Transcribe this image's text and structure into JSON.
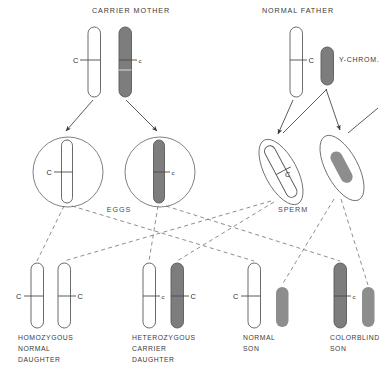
{
  "diagram": {
    "parents": [
      {
        "id": "mother",
        "label": "CARRIER MOTHER",
        "label_x": 131,
        "label_y": 13,
        "chromosomes": [
          {
            "id": "mother-x-normal",
            "type": "X",
            "fill": "white",
            "allele": "C",
            "allele_case": "upper",
            "allele_side": "left",
            "x": 88,
            "y": 27,
            "w": 12.5,
            "h": 70
          },
          {
            "id": "mother-x-carrier",
            "type": "X",
            "fill": "gray",
            "allele": "c",
            "allele_case": "lower",
            "allele_side": "right",
            "x": 119,
            "y": 27,
            "w": 12.5,
            "h": 70
          }
        ]
      },
      {
        "id": "father",
        "label": "NORMAL FATHER",
        "label_x": 298,
        "label_y": 13,
        "chromosomes": [
          {
            "id": "father-x",
            "type": "X",
            "fill": "white",
            "allele": "C",
            "allele_case": "upper",
            "allele_side": "right",
            "x": 290,
            "y": 27,
            "w": 12.5,
            "h": 70
          },
          {
            "id": "father-y",
            "type": "Y",
            "fill": "gray",
            "allele": "",
            "allele_case": "",
            "allele_side": "",
            "x": 321,
            "y": 47,
            "w": 12.5,
            "h": 38
          }
        ],
        "y_chrom_label": "Y-CHROM.",
        "y_chrom_label_x": 339,
        "y_chrom_label_y": 62
      }
    ],
    "gametes": [
      {
        "id": "egg-normal",
        "group": "EGGS",
        "shape": "circle",
        "cx": 68,
        "cy": 172,
        "r": 35,
        "chromosome": {
          "type": "X",
          "fill": "white",
          "allele": "C",
          "allele_case": "upper",
          "allele_side": "left"
        }
      },
      {
        "id": "egg-carrier",
        "group": "EGGS",
        "shape": "circle",
        "cx": 160,
        "cy": 172,
        "r": 35,
        "chromosome": {
          "type": "X",
          "fill": "gray",
          "allele": "c",
          "allele_case": "lower",
          "allele_side": "right"
        }
      },
      {
        "id": "sperm-x",
        "group": "SPERM",
        "shape": "ellipse",
        "cx": 281,
        "cy": 172,
        "rx": 16,
        "ry": 36,
        "rotation": -28,
        "chromosome": {
          "type": "X",
          "fill": "white",
          "allele": "C",
          "allele_case": "upper",
          "allele_side": "right"
        }
      },
      {
        "id": "sperm-y",
        "group": "SPERM",
        "shape": "ellipse",
        "cx": 342,
        "cy": 168,
        "rx": 16,
        "ry": 36,
        "rotation": -28,
        "chromosome": {
          "type": "Y",
          "fill": "gray",
          "allele": "",
          "allele_case": "",
          "allele_side": ""
        }
      }
    ],
    "gamete_group_labels": [
      {
        "id": "eggs-label",
        "text": "EGGS",
        "x": 119,
        "y": 212
      },
      {
        "id": "sperm-label",
        "text": "SPERM",
        "x": 293,
        "y": 212
      }
    ],
    "offspring": [
      {
        "id": "homozygous-normal-daughter",
        "caption_lines": [
          "HOMOZYGOUS",
          "NORMAL",
          "DAUGHTER"
        ],
        "caption_x": 18,
        "caption_y": 340,
        "chromosomes": [
          {
            "type": "X",
            "fill": "white",
            "allele": "C",
            "allele_case": "upper",
            "allele_side": "left",
            "x": 31,
            "y": 263,
            "w": 12.5,
            "h": 65
          },
          {
            "type": "X",
            "fill": "white",
            "allele": "C",
            "allele_case": "upper",
            "allele_side": "right",
            "x": 58,
            "y": 263,
            "w": 12.5,
            "h": 65
          }
        ]
      },
      {
        "id": "heterozygous-carrier-daughter",
        "caption_lines": [
          "HETEROZYGOUS",
          "CARRIER",
          "DAUGHTER"
        ],
        "caption_x": 132,
        "caption_y": 340,
        "chromosomes": [
          {
            "type": "X",
            "fill": "white",
            "allele": "c",
            "allele_case": "lower",
            "allele_side": "right",
            "x": 143,
            "y": 263,
            "w": 12.5,
            "h": 65
          },
          {
            "type": "X",
            "fill": "gray",
            "allele": "C",
            "allele_case": "upper",
            "allele_side": "right",
            "x": 171,
            "y": 263,
            "w": 12.5,
            "h": 65
          }
        ]
      },
      {
        "id": "normal-son",
        "caption_lines": [
          "NORMAL",
          "SON"
        ],
        "caption_x": 243,
        "caption_y": 340,
        "chromosomes": [
          {
            "type": "X",
            "fill": "white",
            "allele": "C",
            "allele_case": "upper",
            "allele_side": "left",
            "x": 248,
            "y": 263,
            "w": 12.5,
            "h": 65
          },
          {
            "type": "Y",
            "fill": "gray",
            "allele": "",
            "allele_case": "",
            "allele_side": "",
            "x": 276,
            "y": 287,
            "w": 12.5,
            "h": 40
          }
        ]
      },
      {
        "id": "colorblind-son",
        "caption_lines": [
          "COLORBLIND",
          "SON"
        ],
        "caption_x": 330,
        "caption_y": 340,
        "chromosomes": [
          {
            "type": "X",
            "fill": "gray",
            "allele": "c",
            "allele_case": "lower",
            "allele_side": "right",
            "x": 334,
            "y": 263,
            "w": 12.5,
            "h": 65
          },
          {
            "type": "Y",
            "fill": "gray",
            "allele": "",
            "allele_case": "",
            "allele_side": "",
            "x": 362,
            "y": 287,
            "w": 12.5,
            "h": 40
          }
        ]
      }
    ],
    "colors": {
      "chromosome_gray": "#7d7d7d",
      "chromosome_white": "#ffffff",
      "outline": "#5a5a5a",
      "text": "#3a3a3a",
      "dashed_line": "#6a6a6a"
    }
  }
}
